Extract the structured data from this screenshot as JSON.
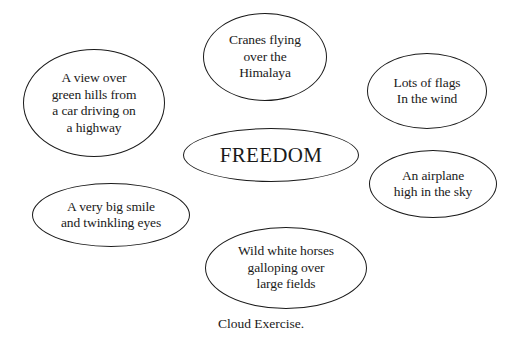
{
  "diagram": {
    "type": "cloud-exercise-mind-map",
    "center": {
      "label": "FREEDOM",
      "geometry": {
        "cx": 271,
        "cy": 155,
        "rx": 88,
        "ry": 27
      }
    },
    "bubbles": [
      {
        "id": "cranes",
        "label": "Cranes flying\nover the\nHimalaya",
        "geometry": {
          "cx": 265,
          "cy": 57,
          "rx": 62,
          "ry": 44
        }
      },
      {
        "id": "view",
        "label": "A view over\ngreen hills from\na car driving on\na highway",
        "geometry": {
          "cx": 94,
          "cy": 103,
          "rx": 71,
          "ry": 54
        }
      },
      {
        "id": "flags",
        "label": "Lots of flags\nIn the wind",
        "geometry": {
          "cx": 427,
          "cy": 91,
          "rx": 60,
          "ry": 38
        }
      },
      {
        "id": "airplane",
        "label": "An airplane\nhigh in the sky",
        "geometry": {
          "cx": 433,
          "cy": 184,
          "rx": 64,
          "ry": 34
        }
      },
      {
        "id": "smile",
        "label": "A very big smile\nand twinkling eyes",
        "geometry": {
          "cx": 111,
          "cy": 215,
          "rx": 79,
          "ry": 32
        }
      },
      {
        "id": "horses",
        "label": "Wild white horses\ngalloping over\nlarge fields",
        "geometry": {
          "cx": 286,
          "cy": 268,
          "rx": 81,
          "ry": 41
        }
      }
    ],
    "caption": "Cloud Exercise.",
    "colors": {
      "background": "#ffffff",
      "stroke": "#1a1a1a",
      "text": "#1a1a1a"
    }
  }
}
